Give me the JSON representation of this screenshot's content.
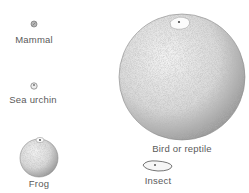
{
  "diagram": {
    "eggs": [
      {
        "label": "Mammal",
        "relative_size": "tiny"
      },
      {
        "label": "Sea urchin",
        "relative_size": "tiny"
      },
      {
        "label": "Frog",
        "relative_size": "small"
      },
      {
        "label": "Bird or reptile",
        "relative_size": "large"
      },
      {
        "label": "Insect",
        "relative_size": "small, elongated"
      }
    ]
  }
}
